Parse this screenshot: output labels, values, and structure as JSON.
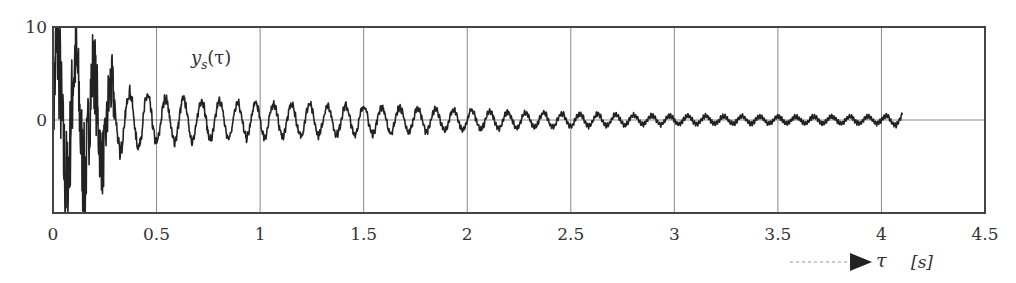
{
  "chart_data": {
    "type": "line",
    "title": "",
    "series_label": "y_s(τ)",
    "series_label_main": "y",
    "series_label_sub": "s",
    "series_label_arg": "(τ)",
    "xlabel": "τ",
    "xunit": "[s]",
    "ylabel": "",
    "xlim": [
      0,
      4.5
    ],
    "ylim": [
      -10,
      10
    ],
    "x_ticks": [
      0,
      0.5,
      1,
      1.5,
      2,
      2.5,
      3,
      3.5,
      4,
      4.5
    ],
    "x_tick_labels": [
      "0",
      "0.5",
      "1",
      "1.5",
      "2",
      "2.5",
      "3",
      "3.5",
      "4",
      "4.5"
    ],
    "y_ticks": [
      10,
      0
    ],
    "y_tick_labels": [
      "10",
      "0"
    ],
    "grid": true,
    "legend": "none",
    "signal": {
      "description": "Damped oscillation with high-frequency noise, decaying amplitude",
      "t_start": 0,
      "t_end": 4.1,
      "dominant_frequency_hz": 11.5,
      "envelope_samples": {
        "t": [
          0,
          0.1,
          0.2,
          0.3,
          0.5,
          0.75,
          1.0,
          1.5,
          2.0,
          2.5,
          3.0,
          3.5,
          4.0,
          4.1
        ],
        "amplitude": [
          10,
          9,
          7,
          4.5,
          3.2,
          2.8,
          2.4,
          2.0,
          1.4,
          0.9,
          0.6,
          0.5,
          0.5,
          0.9
        ]
      },
      "peak_max": 10,
      "peak_min": -10
    },
    "colors": {
      "line": "#222222",
      "grid": "#8a8a8a",
      "frame": "#444444",
      "arrow": "#222222"
    }
  }
}
